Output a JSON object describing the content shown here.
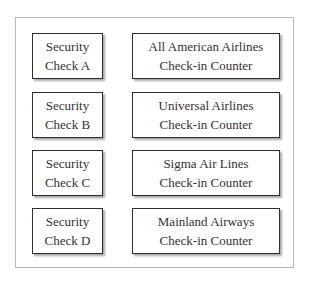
{
  "rows": [
    {
      "security": {
        "line1": "Security",
        "line2": "Check A"
      },
      "counter": {
        "line1": "All American Airlines",
        "line2": "Check-in Counter"
      }
    },
    {
      "security": {
        "line1": "Security",
        "line2": "Check B"
      },
      "counter": {
        "line1": "Universal Airlines",
        "line2": "Check-in Counter"
      }
    },
    {
      "security": {
        "line1": "Security",
        "line2": "Check C"
      },
      "counter": {
        "line1": "Sigma Air Lines",
        "line2": "Check-in Counter"
      }
    },
    {
      "security": {
        "line1": "Security",
        "line2": "Check D"
      },
      "counter": {
        "line1": "Mainland Airways",
        "line2": "Check-in Counter"
      }
    }
  ],
  "colors": {
    "border": "#2e2e2e",
    "frame": "#b9b9b9",
    "text": "#333333"
  }
}
